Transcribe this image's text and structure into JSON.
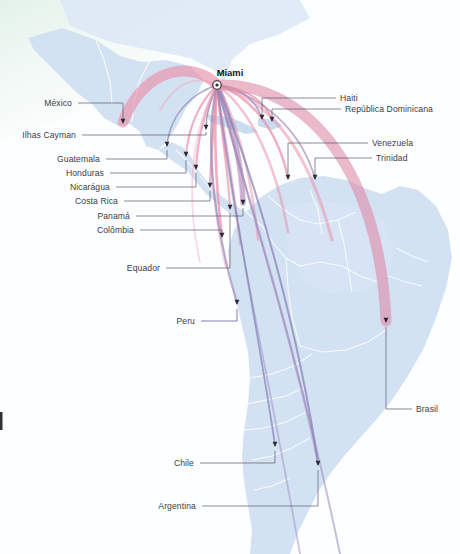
{
  "figure": {
    "type": "flow-map",
    "title_hub": "Miami"
  },
  "colors": {
    "background": "#ffffff",
    "ocean": "#fbfcfe",
    "ocean_tint_green": "#e7f3ec",
    "land": "#cfe0f2",
    "land_light": "#dde9f7",
    "border": "#ffffff",
    "arc_pink": "#ec8ba4",
    "arc_pink_soft": "#f2a9bc",
    "arc_mauve": "#b389b4",
    "arc_purple": "#8a84b8",
    "leader_line": "#5a5a68",
    "leader_line_peru": "#6f6fbe",
    "label_text": "#3c3c46",
    "hub_label_text": "#14141c",
    "marker": "#2a2a33"
  },
  "hub": {
    "name": "Miami",
    "x": 217,
    "y": 85,
    "marker": "target-circle-icon"
  },
  "destinations": [
    {
      "id": "mexico",
      "label": "México",
      "label_x": 72,
      "label_y": 106,
      "label_align": "end",
      "point_x": 123,
      "point_y": 124,
      "leader": "M 78 103 L 123 103 L 123 119",
      "arc": "M 217 85 C 196 62 146 63 123 122",
      "arc_color": "#ec8ba4",
      "arc_width": 11,
      "arc_opacity": 0.62
    },
    {
      "id": "ilhas-cayman",
      "label": "Ilhas Cayman",
      "label_x": 76,
      "label_y": 138,
      "label_align": "end",
      "point_x": 206,
      "point_y": 130,
      "leader": "M 82 135 L 206 135 L 206 132",
      "arc": "M 217 85 C 213 97 206 110 206 128",
      "arc_color": "#8a84b8",
      "arc_width": 1.6,
      "arc_opacity": 0.75
    },
    {
      "id": "guatemala",
      "label": "Guatemala",
      "label_x": 100,
      "label_y": 162,
      "label_align": "end",
      "point_x": 167,
      "point_y": 147,
      "leader": "M 106 159 L 167 159 L 167 150",
      "arc": "M 217 85 C 196 92 171 110 167 145",
      "arc_color": "#8a84b8",
      "arc_width": 1.5,
      "arc_opacity": 0.7
    },
    {
      "id": "honduras",
      "label": "Honduras",
      "label_x": 104,
      "label_y": 176,
      "label_align": "end",
      "point_x": 186,
      "point_y": 157,
      "leader": "M 110 173 L 186 173 L 186 160",
      "arc": "M 217 85 C 202 100 189 122 186 155",
      "arc_color": "#ec8ba4",
      "arc_width": 2.0,
      "arc_opacity": 0.7
    },
    {
      "id": "nicaragua",
      "label": "Nicarágua",
      "label_x": 110,
      "label_y": 190,
      "label_align": "end",
      "point_x": 196,
      "point_y": 170,
      "leader": "M 116 187 L 196 187 L 196 173",
      "arc": "M 217 85 C 207 105 198 135 196 168",
      "arc_color": "#ec8ba4",
      "arc_width": 2.2,
      "arc_opacity": 0.7
    },
    {
      "id": "costa-rica",
      "label": "Costa Rica",
      "label_x": 118,
      "label_y": 204,
      "label_align": "end",
      "point_x": 210,
      "point_y": 188,
      "leader": "M 124 201 L 210 201 L 210 191",
      "arc": "M 217 85 C 214 120 211 155 210 186",
      "arc_color": "#ec8ba4",
      "arc_width": 2.2,
      "arc_opacity": 0.7
    },
    {
      "id": "panama",
      "label": "Panamá",
      "label_x": 130,
      "label_y": 219,
      "label_align": "end",
      "point_x": 243,
      "point_y": 205,
      "leader": "M 136 216 L 243 216 L 243 208",
      "arc": "M 217 85 C 232 120 242 165 243 203",
      "arc_color": "#a97fb0",
      "arc_width": 5.5,
      "arc_opacity": 0.6
    },
    {
      "id": "colombia",
      "label": "Colômbia",
      "label_x": 134,
      "label_y": 233,
      "label_align": "end",
      "point_x": 222,
      "point_y": 238,
      "leader": "M 140 230 L 222 230 L 222 234",
      "arc": "M 217 85 C 213 140 217 195 222 236",
      "arc_color": "#ec8ba4",
      "arc_width": 2.6,
      "arc_opacity": 0.7
    },
    {
      "id": "equador",
      "label": "Equador",
      "label_x": 160,
      "label_y": 271,
      "label_align": "end",
      "point_x": 230,
      "point_y": 210,
      "leader": "M 166 268 L 230 268 L 230 213",
      "arc": "M 217 85 C 220 125 228 170 230 208",
      "arc_color": "#ec8ba4",
      "arc_width": 2.0,
      "arc_opacity": 0.65
    },
    {
      "id": "peru",
      "label": "Peru",
      "label_x": 195,
      "label_y": 324,
      "label_align": "end",
      "point_x": 237,
      "point_y": 305,
      "leader": "M 201 321 L 237 321 L 237 309",
      "arc": "M 217 85 C 202 150 218 240 237 303",
      "arc_color": "#9a87bc",
      "arc_width": 2.2,
      "arc_opacity": 0.7,
      "leader_color": "#6f6fbe"
    },
    {
      "id": "chile",
      "label": "Chile",
      "label_x": 194,
      "label_y": 466,
      "label_align": "end",
      "point_x": 275,
      "point_y": 447,
      "leader": "M 200 463 L 275 463 L 275 451",
      "arc": "M 217 85 C 230 190 258 330 275 445",
      "arc_color": "#8a84b8",
      "arc_width": 1.8,
      "arc_opacity": 0.75
    },
    {
      "id": "argentina",
      "label": "Argentina",
      "label_x": 196,
      "label_y": 509,
      "label_align": "end",
      "point_x": 318,
      "point_y": 466,
      "leader": "M 202 506 L 318 506 L 318 470",
      "arc": "M 217 85 C 260 190 300 340 318 464",
      "arc_color": "#8a84b8",
      "arc_width": 2.0,
      "arc_opacity": 0.75
    },
    {
      "id": "haiti",
      "label": "Haiti",
      "label_x": 340,
      "label_y": 101,
      "label_align": "start",
      "point_x": 262,
      "point_y": 120,
      "leader": "M 336 98 L 262 98 L 262 116",
      "arc": "M 217 85 C 236 86 254 96 262 118",
      "arc_color": "#8a84b8",
      "arc_width": 1.6,
      "arc_opacity": 0.7
    },
    {
      "id": "republica-dominicana",
      "label": "República Dominicana",
      "label_x": 345,
      "label_y": 112,
      "label_align": "start",
      "point_x": 272,
      "point_y": 122,
      "leader": "M 341 109 L 272 109 L 272 118",
      "arc": "M 217 85 C 242 88 264 98 272 120",
      "arc_color": "#ec8ba4",
      "arc_width": 2.0,
      "arc_opacity": 0.7
    },
    {
      "id": "venezuela",
      "label": "Venezuela",
      "label_x": 372,
      "label_y": 146,
      "label_align": "start",
      "point_x": 288,
      "point_y": 180,
      "leader": "M 368 143 L 288 143 L 288 176",
      "arc": "M 217 85 C 250 95 278 130 288 178",
      "arc_color": "#ec8ba4",
      "arc_width": 2.4,
      "arc_opacity": 0.7
    },
    {
      "id": "trinidad",
      "label": "Trinidad",
      "label_x": 376,
      "label_y": 161,
      "label_align": "start",
      "point_x": 315,
      "point_y": 180,
      "leader": "M 372 158 L 315 158 L 315 176",
      "arc": "M 217 85 C 262 96 300 128 315 178",
      "arc_color": "#a98ab8",
      "arc_width": 1.8,
      "arc_opacity": 0.7
    },
    {
      "id": "brasil",
      "label": "Brasil",
      "label_x": 416,
      "label_y": 412,
      "label_align": "start",
      "point_x": 386,
      "point_y": 323,
      "leader": "M 412 409 L 386 409 L 386 327",
      "arc": "M 217 85 C 310 82 380 175 386 321",
      "arc_color": "#dd8aa6",
      "arc_width": 11,
      "arc_opacity": 0.6
    }
  ],
  "extra_arcs": [
    {
      "id": "arc-extra-1",
      "arc": "M 217 85 C 224 130 235 190 240 245",
      "color": "#ec8ba4",
      "width": 2.0,
      "opacity": 0.5
    },
    {
      "id": "arc-extra-2",
      "arc": "M 217 85 C 238 120 252 180 258 240",
      "color": "#ec8ba4",
      "width": 2.2,
      "opacity": 0.5
    },
    {
      "id": "arc-extra-3",
      "arc": "M 217 85 C 252 110 276 165 288 232",
      "color": "#ec8ba4",
      "width": 2.6,
      "opacity": 0.5
    },
    {
      "id": "arc-extra-4",
      "arc": "M 217 85 C 272 100 310 155 332 240",
      "color": "#ec8ba4",
      "width": 3.0,
      "opacity": 0.5
    },
    {
      "id": "arc-extra-5",
      "arc": "M 217 85 C 208 140 212 210 226 268",
      "color": "#f2a9bc",
      "width": 1.8,
      "opacity": 0.5
    },
    {
      "id": "arc-extra-6",
      "arc": "M 217 85 C 190 130 186 200 200 262",
      "color": "#f2a9bc",
      "width": 1.6,
      "opacity": 0.45
    },
    {
      "id": "arc-extra-7",
      "arc": "M 217 85 C 240 175 286 310 318 462",
      "color": "#b28fc0",
      "width": 2.4,
      "opacity": 0.55
    },
    {
      "id": "arc-extra-8",
      "arc": "M 217 85 C 248 200 300 360 340 554",
      "color": "#9b8bc0",
      "width": 2.0,
      "opacity": 0.55
    },
    {
      "id": "arc-extra-9",
      "arc": "M 217 85 C 228 200 268 370 300 554",
      "color": "#9b8bc0",
      "width": 1.8,
      "opacity": 0.5
    },
    {
      "id": "arc-extra-10",
      "arc": "M 217 85 C 196 75 176 82 160 110",
      "color": "#f2a9bc",
      "width": 2.0,
      "opacity": 0.5
    }
  ],
  "map_regions": [
    {
      "id": "north-america-tint",
      "name": "northern-ocean-tint"
    },
    {
      "id": "mexico-landmass",
      "name": "mexico"
    },
    {
      "id": "central-america",
      "name": "central-america"
    },
    {
      "id": "caribbean",
      "name": "caribbean-islands"
    },
    {
      "id": "south-america",
      "name": "south-america"
    }
  ]
}
